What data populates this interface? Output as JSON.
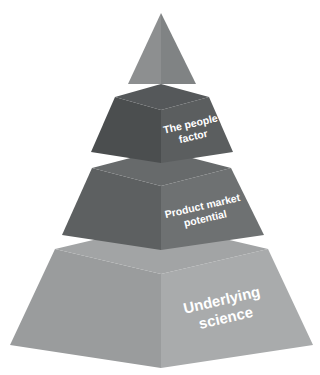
{
  "diagram": {
    "type": "layered-3d-pyramid",
    "title": "",
    "background_color": "#ffffff",
    "orientation": "apex-top",
    "label_color": "#ffffff",
    "label_rotation_degrees": -13,
    "tier_count": 4,
    "tiers": [
      {
        "index": 1,
        "name": "apex",
        "label": "",
        "label_lines": [],
        "font_size": 0,
        "shape": "triangle",
        "colors": {
          "left_face": "#8d8f90",
          "right_face": "#808384",
          "top_face": "#8d8f90"
        },
        "geometry": {
          "apex_x": 161,
          "apex_y": 13,
          "bottom_y": 84,
          "left_x": 128,
          "right_x": 196,
          "mid_x": 161,
          "top_inset": 0
        }
      },
      {
        "index": 2,
        "name": "the-people-factor",
        "label": "The people factor",
        "label_lines": [
          "The people",
          "factor"
        ],
        "font_size": 10.5,
        "shape": "frustum",
        "colors": {
          "left_face": "#4b4e4f",
          "right_face": "#5b5e5f",
          "top_face": "#55585a"
        },
        "geometry": {
          "top_y": 97,
          "bottom_y": 152,
          "top_left_x": 115,
          "top_right_x": 209,
          "bottom_left_x": 91,
          "bottom_right_x": 233,
          "mid_x": 161,
          "top_front_y": 110,
          "bottom_front_y": 163
        },
        "label_anchor": {
          "x": 192,
          "y": 131
        }
      },
      {
        "index": 3,
        "name": "product-market-potential",
        "label": "Product market potential",
        "label_lines": [
          "Product market",
          "potential"
        ],
        "font_size": 10.5,
        "shape": "frustum",
        "colors": {
          "left_face": "#5d6061",
          "right_face": "#6e7172",
          "top_face": "#676a6b"
        },
        "geometry": {
          "top_y": 168,
          "bottom_y": 235,
          "top_left_x": 92,
          "top_right_x": 231,
          "bottom_left_x": 62,
          "bottom_right_x": 264,
          "mid_x": 161,
          "top_front_y": 186,
          "bottom_front_y": 250
        },
        "label_anchor": {
          "x": 204,
          "y": 213
        }
      },
      {
        "index": 4,
        "name": "underlying-science",
        "label": "Underlying science",
        "label_lines": [
          "Underlying",
          "science"
        ],
        "font_size": 15,
        "shape": "frustum",
        "colors": {
          "left_face": "#9a9c9d",
          "right_face": "#a9abac",
          "top_face": "#a2a4a5"
        },
        "geometry": {
          "top_y": 249,
          "bottom_y": 345,
          "top_left_x": 55,
          "top_right_x": 268,
          "bottom_left_x": 10,
          "bottom_right_x": 313,
          "mid_x": 161,
          "top_front_y": 274,
          "bottom_front_y": 368
        },
        "label_anchor": {
          "x": 224,
          "y": 310
        }
      }
    ]
  }
}
